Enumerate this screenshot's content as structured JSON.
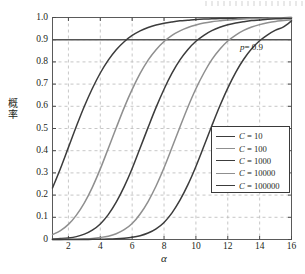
{
  "chart_data": {
    "type": "line",
    "title": "",
    "xlabel": "α",
    "ylabel": "概率",
    "xlim": [
      1,
      16
    ],
    "ylim": [
      0,
      1.0
    ],
    "grid": true,
    "grid_style": "dashed",
    "legend_position": "center-right",
    "xticks": [
      "2",
      "4",
      "6",
      "8",
      "10",
      "12",
      "14",
      "16"
    ],
    "xtick_values": [
      2,
      4,
      6,
      8,
      10,
      12,
      14,
      16
    ],
    "yticks": [
      "0",
      "0.1",
      "0.2",
      "0.3",
      "0.4",
      "0.5",
      "0.6",
      "0.7",
      "0.8",
      "0.9",
      "1.0"
    ],
    "ytick_values": [
      0,
      0.1,
      0.2,
      0.3,
      0.4,
      0.5,
      0.6,
      0.7,
      0.8,
      0.9,
      1.0
    ],
    "annotations": [
      {
        "name": "p-threshold",
        "label": "p = 0.9",
        "label_var": "p",
        "label_rest": "= 0.9",
        "y": 0.9,
        "type": "horizontal-line"
      }
    ],
    "x": [
      1,
      1.5,
      2,
      2.5,
      3,
      3.5,
      4,
      4.5,
      5,
      5.5,
      6,
      6.5,
      7,
      7.5,
      8,
      8.5,
      9,
      9.5,
      10,
      10.5,
      11,
      11.5,
      12,
      12.5,
      13,
      13.5,
      14,
      14.5,
      15,
      15.5,
      16
    ],
    "series": [
      {
        "name": "C = 10",
        "name_var": "C",
        "name_rest": "= 10",
        "color": "#3c3c3c",
        "values": [
          0.232,
          0.32,
          0.415,
          0.51,
          0.6,
          0.68,
          0.75,
          0.808,
          0.855,
          0.891,
          0.919,
          0.94,
          0.955,
          0.966,
          0.974,
          0.98,
          0.985,
          0.988,
          0.991,
          0.993,
          0.994,
          0.995,
          0.996,
          0.997,
          0.998,
          0.998,
          0.999,
          0.999,
          0.999,
          0.999,
          1.0
        ]
      },
      {
        "name": "C = 100",
        "name_var": "C",
        "name_rest": "= 100",
        "color": "#8f8f8f",
        "values": [
          0.022,
          0.04,
          0.068,
          0.11,
          0.165,
          0.235,
          0.318,
          0.41,
          0.503,
          0.594,
          0.676,
          0.748,
          0.808,
          0.855,
          0.892,
          0.92,
          0.94,
          0.955,
          0.966,
          0.975,
          0.981,
          0.985,
          0.989,
          0.991,
          0.993,
          0.995,
          0.996,
          0.997,
          0.998,
          0.998,
          0.999
        ]
      },
      {
        "name": "C = 1000",
        "name_var": "C",
        "name_rest": "= 1000",
        "color": "#3c3c3c",
        "values": [
          0.002,
          0.004,
          0.007,
          0.013,
          0.024,
          0.042,
          0.07,
          0.112,
          0.168,
          0.238,
          0.32,
          0.412,
          0.505,
          0.595,
          0.677,
          0.749,
          0.809,
          0.856,
          0.893,
          0.92,
          0.941,
          0.956,
          0.967,
          0.975,
          0.981,
          0.986,
          0.989,
          0.992,
          0.994,
          0.995,
          0.996
        ]
      },
      {
        "name": "C = 10000",
        "name_var": "C",
        "name_rest": "= 10000",
        "color": "#8f8f8f",
        "values": [
          0.0002,
          0.0004,
          0.0008,
          0.0015,
          0.003,
          0.005,
          0.009,
          0.015,
          0.026,
          0.044,
          0.072,
          0.115,
          0.171,
          0.241,
          0.323,
          0.414,
          0.507,
          0.597,
          0.679,
          0.75,
          0.81,
          0.857,
          0.894,
          0.921,
          0.942,
          0.957,
          0.968,
          0.976,
          0.982,
          0.986,
          0.99
        ]
      },
      {
        "name": "C = 100000",
        "name_var": "C",
        "name_rest": "= 100000",
        "color": "#3c3c3c",
        "values": [
          2e-05,
          5e-05,
          0.0001,
          0.0002,
          0.0004,
          0.0007,
          0.0012,
          0.002,
          0.0035,
          0.006,
          0.01,
          0.017,
          0.029,
          0.048,
          0.077,
          0.12,
          0.177,
          0.247,
          0.329,
          0.42,
          0.512,
          0.601,
          0.682,
          0.753,
          0.812,
          0.859,
          0.895,
          0.922,
          0.943,
          0.958,
          0.985
        ]
      }
    ]
  }
}
